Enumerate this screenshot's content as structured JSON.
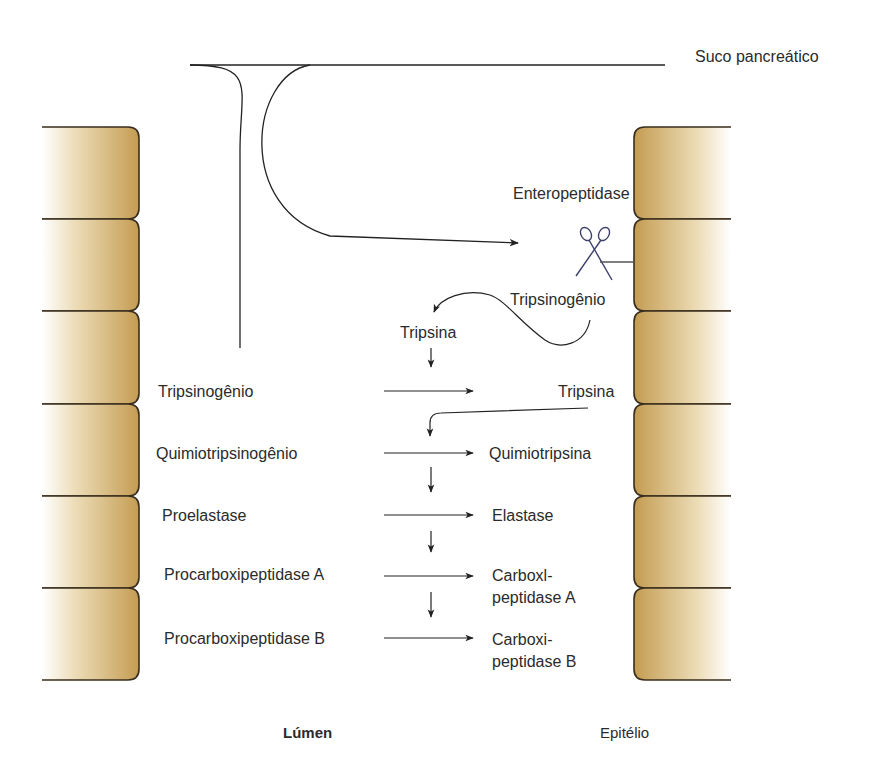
{
  "diagram": {
    "source_label": "Suco pancreático",
    "enzyme_label": "Enteropeptidase",
    "cleaved_label": "Tripsinogênio",
    "autocat_label": "Tripsina",
    "rows": [
      {
        "precursor": "Tripsinogênio",
        "product": "Tripsina"
      },
      {
        "precursor": "Quimiotripsinogênio",
        "product": "Quimiotripsina"
      },
      {
        "precursor": "Proelastase",
        "product": "Elastase"
      },
      {
        "precursor": "Procarboxipeptidase A",
        "product": "Carboxl-\npeptidase A"
      },
      {
        "precursor": "Procarboxipeptidase B",
        "product": "Carboxi-\npeptidase B"
      }
    ],
    "lumen_label": "Lúmen",
    "epithelium_label": "Epitélio"
  },
  "colors": {
    "cell_fill_dark": "#c9a258",
    "cell_fill_light": "#ffffff",
    "cell_outline": "#3a2e1e",
    "line": "#222222",
    "scissors": "#3c3f6a"
  }
}
